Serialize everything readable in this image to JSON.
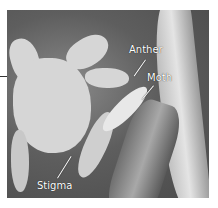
{
  "figure": {
    "labels": [
      {
        "text": "Anther"
      },
      {
        "text": "Moth"
      },
      {
        "text": "Stigma"
      }
    ]
  }
}
